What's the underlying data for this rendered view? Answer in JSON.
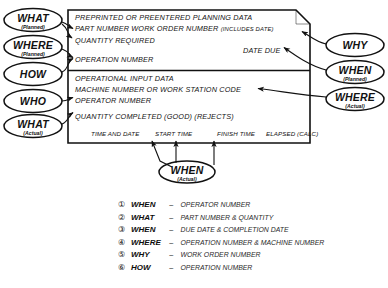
{
  "diagram": {
    "stroke_color": "#111111",
    "background": "#ffffff",
    "left_nodes": [
      {
        "main": "WHAT",
        "sub": "(Planned)"
      },
      {
        "main": "WHERE",
        "sub": "(Planned)"
      },
      {
        "main": "HOW",
        "sub": ""
      },
      {
        "main": "WHO",
        "sub": ""
      },
      {
        "main": "WHAT",
        "sub": "(Actual)"
      }
    ],
    "right_nodes": [
      {
        "main": "WHY",
        "sub": ""
      },
      {
        "main": "WHEN",
        "sub": "(Planned)"
      },
      {
        "main": "WHERE",
        "sub": "(Actual)"
      }
    ],
    "bottom_nodes": [
      {
        "main": "WHEN",
        "sub": "(Actual)"
      }
    ],
    "form": {
      "section_planned": {
        "heading": "PREPRINTED OR PREENTERED PLANNING DATA",
        "lines": [
          {
            "text": "PART NUMBER  WORK ORDER NUMBER ",
            "note": "(INCLUDES DATE)"
          },
          {
            "text": "QUANTITY REQUIRED",
            "note": ""
          },
          {
            "text": "OPERATION NUMBER",
            "note": ""
          }
        ],
        "right_field": "DATE DUE"
      },
      "section_actual": {
        "heading": "OPERATIONAL INPUT DATA",
        "lines": [
          {
            "text": "MACHINE NUMBER OR WORK STATION CODE",
            "note": ""
          },
          {
            "text": "OPERATOR NUMBER",
            "note": ""
          },
          {
            "text": "QUANTITY COMPLETED (GOOD) (REJECTS)",
            "note": ""
          }
        ],
        "columns": [
          "TIME AND DATE",
          "START TIME",
          "FINISH TIME",
          "ELAPSED (CALC)"
        ]
      }
    }
  },
  "legend": {
    "items": [
      {
        "num": "①",
        "key": "WHEN",
        "dash": "–",
        "value": "OPERATOR NUMBER"
      },
      {
        "num": "②",
        "key": "WHAT",
        "dash": "–",
        "value": "PART NUMBER & QUANTITY"
      },
      {
        "num": "③",
        "key": "WHEN",
        "dash": "–",
        "value": "DUE DATE & COMPLETION DATE"
      },
      {
        "num": "④",
        "key": "WHERE",
        "dash": "–",
        "value": "OPERATION NUMBER & MACHINE NUMBER"
      },
      {
        "num": "⑤",
        "key": "WHY",
        "dash": "–",
        "value": "WORK ORDER NUMBER"
      },
      {
        "num": "⑥",
        "key": "HOW",
        "dash": "–",
        "value": "OPERATION NUMBER"
      }
    ]
  }
}
